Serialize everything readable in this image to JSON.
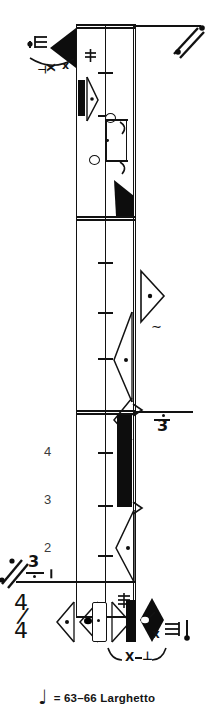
{
  "document": {
    "kind": "rotated-music-score",
    "orientation": "staff rotated 90 degrees (lines run vertically)",
    "background_color": "#ffffff",
    "ink_color": "#121212"
  },
  "score": {
    "time_signature": {
      "numerator": "4",
      "denominator": "4"
    },
    "bar_numbers": [
      "4",
      "3",
      "2"
    ],
    "tuplets": [
      {
        "label": "3",
        "has_dot": true,
        "position": "right-middle"
      },
      {
        "label": "3",
        "has_dot": true,
        "position": "left-lower"
      }
    ],
    "articulation_text": [
      "X",
      "⊥",
      "X",
      "⊥"
    ],
    "repeat_marks": [
      "caesura-top-right",
      "caesura-bottom-left"
    ]
  },
  "tempo": {
    "note_glyph": "♩",
    "equals": "=",
    "bpm_range": "63–66",
    "term": "Larghetto",
    "full_text": "= 63–66 Larghetto"
  }
}
